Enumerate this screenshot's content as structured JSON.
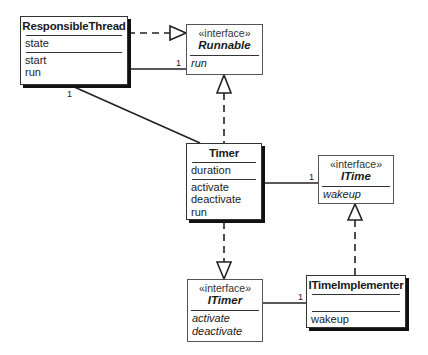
{
  "diagram": {
    "type": "UML class diagram",
    "classes": [
      {
        "id": "responsible-thread",
        "name": "ResponsibleThread",
        "stereotype": null,
        "attributes": [
          "state"
        ],
        "operations": [
          "start",
          "run"
        ]
      },
      {
        "id": "runnable",
        "name": "Runnable",
        "stereotype": "«interface»",
        "attributes": [],
        "operations": [
          "run"
        ]
      },
      {
        "id": "timer",
        "name": "Timer",
        "stereotype": null,
        "attributes": [
          "duration"
        ],
        "operations": [
          "activate",
          "deactivate",
          "run"
        ]
      },
      {
        "id": "itime",
        "name": "ITime",
        "stereotype": "«interface»",
        "attributes": [],
        "operations": [
          "wakeup"
        ]
      },
      {
        "id": "itimer",
        "name": "ITimer",
        "stereotype": "«interface»",
        "attributes": [],
        "operations": [
          "activate",
          "deactivate"
        ]
      },
      {
        "id": "itime-implementer",
        "name": "ITimeImplementer",
        "stereotype": null,
        "attributes": [],
        "operations": [
          "wakeup"
        ]
      }
    ],
    "relationships": [
      {
        "from": "ResponsibleThread",
        "to": "Runnable",
        "kind": "realization"
      },
      {
        "from": "ResponsibleThread",
        "to": "Runnable",
        "kind": "association",
        "multiplicity_to": "1"
      },
      {
        "from": "Timer",
        "to": "ResponsibleThread",
        "kind": "association",
        "multiplicity_to": "1"
      },
      {
        "from": "Timer",
        "to": "Runnable",
        "kind": "realization"
      },
      {
        "from": "Timer",
        "to": "ITime",
        "kind": "association",
        "multiplicity_to": "1"
      },
      {
        "from": "Timer",
        "to": "ITimer",
        "kind": "realization"
      },
      {
        "from": "ITimeImplementer",
        "to": "ITime",
        "kind": "realization"
      },
      {
        "from": "ITimeImplementer",
        "to": "ITimer",
        "kind": "association",
        "multiplicity_to": "1"
      }
    ],
    "multiplicity_labels": {
      "rt_runnable": "1",
      "timer_rt": "1",
      "timer_itime": "1",
      "impl_itimer": "1"
    }
  }
}
